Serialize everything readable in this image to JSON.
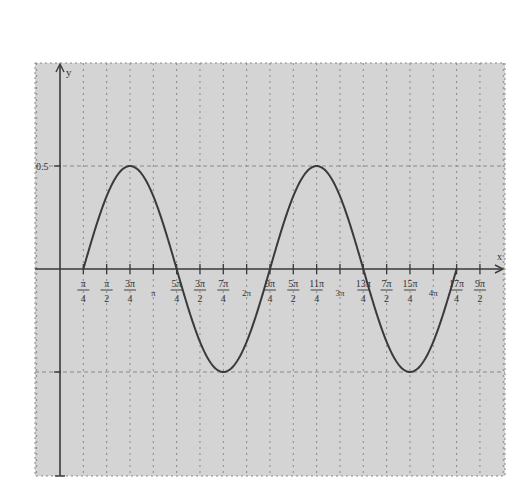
{
  "chart_data": {
    "type": "line",
    "title": "",
    "xlabel": "x",
    "ylabel": "y",
    "function": "y = 0.5·sin(x − π/4), for π/4 ≤ x ≤ 17π/4",
    "xlim": [
      -0.7854,
      14.1372
    ],
    "ylim": [
      -0.85,
      1.0
    ],
    "grid": true,
    "y_ticks": [
      {
        "value": 0.5,
        "label": "0.5"
      },
      {
        "value": -0.5,
        "label": ""
      }
    ],
    "x_ticks": [
      {
        "value": 0.7854,
        "num": "π",
        "den": "4"
      },
      {
        "value": 1.5708,
        "num": "π",
        "den": "2"
      },
      {
        "value": 2.3562,
        "num": "3π",
        "den": "4"
      },
      {
        "value": 3.1416,
        "num": "π",
        "den": ""
      },
      {
        "value": 3.927,
        "num": "5π",
        "den": "4"
      },
      {
        "value": 4.7124,
        "num": "3π",
        "den": "2"
      },
      {
        "value": 5.4978,
        "num": "7π",
        "den": "4"
      },
      {
        "value": 6.2832,
        "num": "2π",
        "den": ""
      },
      {
        "value": 7.0686,
        "num": "9π",
        "den": "4"
      },
      {
        "value": 7.854,
        "num": "5π",
        "den": "2"
      },
      {
        "value": 8.6394,
        "num": "11π",
        "den": "4"
      },
      {
        "value": 9.4248,
        "num": "3π",
        "den": ""
      },
      {
        "value": 10.2102,
        "num": "13π",
        "den": "4"
      },
      {
        "value": 10.9956,
        "num": "7π",
        "den": "2"
      },
      {
        "value": 11.781,
        "num": "15π",
        "den": "4"
      },
      {
        "value": 12.5664,
        "num": "4π",
        "den": ""
      },
      {
        "value": 13.3518,
        "num": "17π",
        "den": "4"
      },
      {
        "value": 14.1372,
        "num": "9π",
        "den": "2"
      }
    ],
    "key_points": [
      {
        "x": "π/4",
        "y": 0
      },
      {
        "x": "3π/4",
        "y": 0.5
      },
      {
        "x": "5π/4",
        "y": 0
      },
      {
        "x": "7π/4",
        "y": -0.5
      },
      {
        "x": "9π/4",
        "y": 0
      },
      {
        "x": "11π/4",
        "y": 0.5
      },
      {
        "x": "13π/4",
        "y": 0
      },
      {
        "x": "15π/4",
        "y": -0.5
      },
      {
        "x": "17π/4",
        "y": 0
      }
    ]
  },
  "layout": {
    "plot_left": 35,
    "plot_right": 505,
    "plot_top": 63,
    "plot_bottom": 476,
    "origin_x": 60,
    "origin_y": 269,
    "px_per_quarter_pi": 23.33,
    "px_per_unit_y": 206,
    "colors": {
      "background": "#d4d4d4",
      "grid": "#8a8a8a",
      "axis": "#3a3a3a",
      "curve": "#3a3a3a"
    }
  }
}
